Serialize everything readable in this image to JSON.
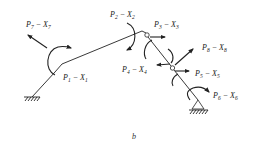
{
  "figure": {
    "caption": "b",
    "labels": [
      {
        "id": "p7",
        "P": "P",
        "Psub": "7",
        "X": "X",
        "Xsub": "7"
      },
      {
        "id": "p1",
        "P": "P",
        "Psub": "1",
        "X": "X",
        "Xsub": "1"
      },
      {
        "id": "p2",
        "P": "P",
        "Psub": "2",
        "X": "X",
        "Xsub": "2"
      },
      {
        "id": "p3",
        "P": "P",
        "Psub": "3",
        "X": "X",
        "Xsub": "3"
      },
      {
        "id": "p4",
        "P": "P",
        "Psub": "4",
        "X": "X",
        "Xsub": "4"
      },
      {
        "id": "p5",
        "P": "P",
        "Psub": "5",
        "X": "X",
        "Xsub": "5"
      },
      {
        "id": "p6",
        "P": "P",
        "Psub": "6",
        "X": "X",
        "Xsub": "6"
      },
      {
        "id": "p8",
        "P": "P",
        "Psub": "8",
        "X": "X",
        "Xsub": "8"
      }
    ],
    "dash": "−"
  }
}
